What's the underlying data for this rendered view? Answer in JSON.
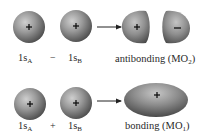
{
  "diagram": {
    "type": "molecular-orbital-combination",
    "rows": [
      {
        "id": "antibonding",
        "left_orbital": {
          "name": "1s",
          "subscript": "A",
          "phase_sign": "+"
        },
        "operator": "−",
        "right_orbital": {
          "name": "1s",
          "subscript": "B",
          "phase_sign": "+"
        },
        "result": {
          "label": "antibonding (MO",
          "subscript": "2",
          "close": ")",
          "lobes": [
            {
              "phase_sign": "+"
            },
            {
              "phase_sign": "−"
            }
          ]
        }
      },
      {
        "id": "bonding",
        "left_orbital": {
          "name": "1s",
          "subscript": "A",
          "phase_sign": "+"
        },
        "operator": "+",
        "right_orbital": {
          "name": "1s",
          "subscript": "B",
          "phase_sign": "+"
        },
        "result": {
          "label": "bonding (MO",
          "subscript": "1",
          "close": ")",
          "lobes": [
            {
              "phase_sign": "+"
            }
          ]
        }
      }
    ],
    "arrow_icon": "right-arrow"
  },
  "colors": {
    "orbital_highlight": "#c8c8c8",
    "orbital_mid": "#8a8a8a",
    "orbital_edge": "#4a4a4a",
    "text": "#2a2a2a"
  }
}
